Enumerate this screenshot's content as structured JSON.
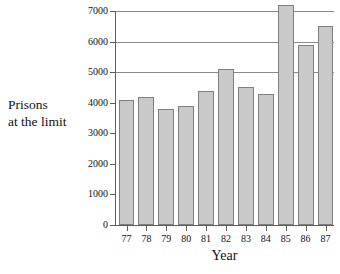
{
  "chart_data": {
    "type": "bar",
    "title": "",
    "xlabel": "Year",
    "ylabel": "Prisons at the limit",
    "ylabel_lines": [
      "Prisons",
      "at the limit"
    ],
    "categories": [
      "77",
      "78",
      "79",
      "80",
      "81",
      "82",
      "83",
      "84",
      "85",
      "86",
      "87"
    ],
    "values": [
      4100,
      4200,
      3800,
      3900,
      4400,
      5100,
      4500,
      4300,
      7200,
      5900,
      6500
    ],
    "ylim": [
      0,
      7000
    ],
    "yticks": [
      0,
      1000,
      2000,
      3000,
      4000,
      5000,
      6000,
      7000
    ],
    "ytick_labels": [
      "0",
      "1000",
      "2000",
      "3000",
      "4000",
      "5000",
      "6000",
      "7000"
    ],
    "gridlines": [
      5000,
      6000,
      7000
    ],
    "grid": true,
    "legend": null,
    "series": [
      {
        "name": "Prisons at the limit",
        "values": [
          4100,
          4200,
          3800,
          3900,
          4400,
          5100,
          4500,
          4300,
          7200,
          5900,
          6500
        ]
      }
    ],
    "bar_fill_color": "#c9c9c9",
    "bar_border_color": "#7f7f7f",
    "axis_color": "#5d5d5d",
    "gridline_color": "#8a8a8a",
    "background_color": "#ffffff"
  }
}
